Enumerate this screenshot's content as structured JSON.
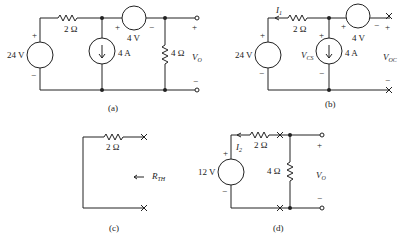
{
  "figures": [
    {
      "id": "a",
      "caption": "(a)",
      "source_voltage": "24 V",
      "series_resistor": "2 Ω",
      "current_source": "4 A",
      "voltage_source": "4 V",
      "load_resistor": "4 Ω",
      "output_label": "V",
      "output_sub": "O",
      "plus": "+",
      "minus": "−"
    },
    {
      "id": "b",
      "caption": "(b)",
      "source_voltage": "24 V",
      "series_resistor": "2 Ω",
      "current_source": "4 A",
      "voltage_source": "4 V",
      "current_label": "I",
      "current_sub": "1",
      "vcs_label": "V",
      "vcs_sub": "CS",
      "output_label": "V",
      "output_sub": "OC",
      "plus": "+",
      "minus": "−"
    },
    {
      "id": "c",
      "caption": "(c)",
      "series_resistor": "2 Ω",
      "rth_label": "R",
      "rth_sub": "TH"
    },
    {
      "id": "d",
      "caption": "(d)",
      "source_voltage": "12 V",
      "series_resistor": "2 Ω",
      "load_resistor": "4 Ω",
      "current_label": "I",
      "current_sub": "2",
      "output_label": "V",
      "output_sub": "O",
      "plus": "+",
      "minus": "−"
    }
  ]
}
